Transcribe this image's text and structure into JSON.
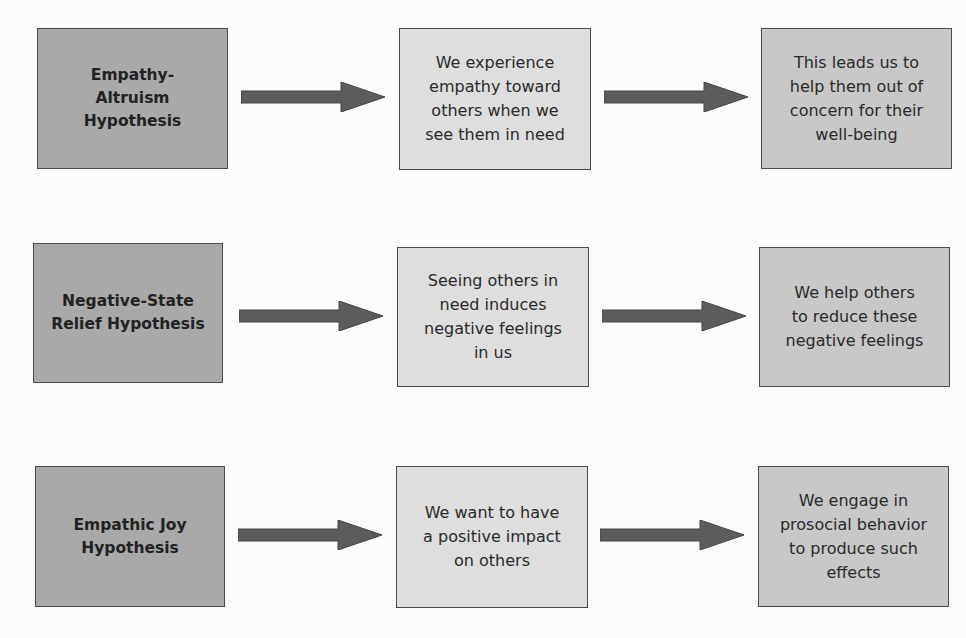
{
  "diagram": {
    "colors": {
      "hypothesis_box": "#a9a9a9",
      "middle_box": "#dedede",
      "outcome_box": "#c8c8c8",
      "arrow": "#5c5c5c",
      "border": "#4a4a4a"
    },
    "rows": [
      {
        "hypothesis": "Empathy-\nAltruism\nHypothesis",
        "cause": "We experience\nempathy toward\nothers when we\nsee them in need",
        "outcome": "This leads us to\nhelp them out of\nconcern for their\nwell-being"
      },
      {
        "hypothesis": "Negative-State\nRelief Hypothesis",
        "cause": "Seeing others in\nneed induces\nnegative feelings\nin us",
        "outcome": "We help others\nto reduce these\nnegative feelings"
      },
      {
        "hypothesis": "Empathic Joy\nHypothesis",
        "cause": "We want to have\na positive impact\non others",
        "outcome": "We engage in\nprosocial behavior\nto produce such\neffects"
      }
    ]
  }
}
